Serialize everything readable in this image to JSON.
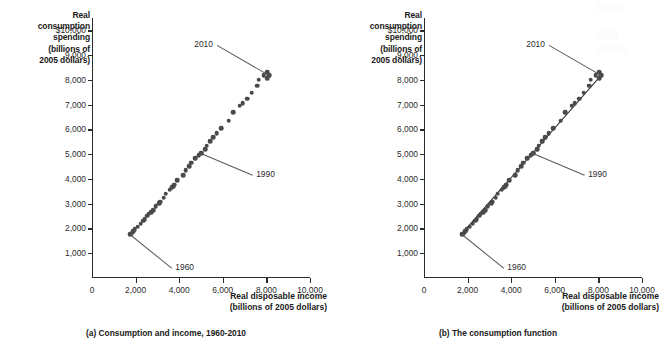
{
  "figure": {
    "panels": [
      {
        "id": "a",
        "caption": "(a) Consumption and income, 1960-2010",
        "show_fit_line": false
      },
      {
        "id": "b",
        "caption": "(b)  The consumption function",
        "show_fit_line": true
      }
    ],
    "axis_titles": {
      "y_lines": [
        "Real",
        "consumption",
        "spending",
        "(billions of",
        "2005 dollars)"
      ],
      "x_lines": [
        "Real disposable income",
        "(billions of 2005 dollars)"
      ]
    },
    "annotations": [
      {
        "label": "1960",
        "target": "first-point"
      },
      {
        "label": "1990",
        "target": "mid-point"
      },
      {
        "label": "2010",
        "target": "last-point"
      }
    ]
  },
  "chart_data": {
    "type": "scatter",
    "title": "",
    "xlabel": "Real disposable income (billions of 2005 dollars)",
    "ylabel": "Real consumption spending (billions of 2005 dollars)",
    "xlim": [
      0,
      10000
    ],
    "ylim": [
      0,
      10500
    ],
    "grid": false,
    "legend": false,
    "x_ticks": [
      0,
      2000,
      4000,
      6000,
      8000,
      10000
    ],
    "x_tick_labels": [
      "0",
      "2,000",
      "4,000",
      "6,000",
      "8,000",
      "10,000"
    ],
    "y_ticks": [
      1000,
      2000,
      3000,
      4000,
      5000,
      6000,
      7000,
      8000,
      9000,
      10000
    ],
    "y_tick_labels": [
      "1,000",
      "2,000",
      "3,000",
      "4,000",
      "5,000",
      "6,000",
      "7,000",
      "8,000",
      "9,000",
      "$10,000"
    ],
    "marker_color": "#4a4a4a",
    "line_color": "#2b2b2b",
    "series": [
      {
        "name": "Consumption vs. disposable income, 1960-2010",
        "years": [
          1960,
          1961,
          1962,
          1963,
          1964,
          1965,
          1966,
          1967,
          1968,
          1969,
          1970,
          1971,
          1972,
          1973,
          1974,
          1975,
          1976,
          1977,
          1978,
          1979,
          1980,
          1981,
          1982,
          1983,
          1984,
          1985,
          1986,
          1987,
          1988,
          1989,
          1990,
          1991,
          1992,
          1993,
          1994,
          1995,
          1996,
          1997,
          1998,
          1999,
          2000,
          2001,
          2002,
          2003,
          2004,
          2005,
          2006,
          2007,
          2008,
          2009,
          2010
        ],
        "x": [
          1760,
          1800,
          1890,
          1960,
          2100,
          2230,
          2340,
          2420,
          2530,
          2610,
          2720,
          2810,
          2930,
          3110,
          3090,
          3160,
          3280,
          3390,
          3560,
          3650,
          3650,
          3740,
          3780,
          3910,
          4180,
          4300,
          4450,
          4550,
          4740,
          4900,
          5010,
          5010,
          5180,
          5270,
          5420,
          5560,
          5720,
          5940,
          6270,
          6490,
          6780,
          6910,
          7130,
          7320,
          7580,
          7650,
          7880,
          8050,
          8100,
          8030,
          8130
        ],
        "y": [
          1760,
          1790,
          1880,
          1960,
          2070,
          2200,
          2320,
          2380,
          2510,
          2600,
          2650,
          2740,
          2910,
          3050,
          3020,
          3080,
          3240,
          3400,
          3560,
          3660,
          3640,
          3700,
          3760,
          3950,
          4140,
          4360,
          4510,
          4650,
          4830,
          4970,
          5060,
          5020,
          5190,
          5340,
          5530,
          5680,
          5840,
          6050,
          6360,
          6690,
          6950,
          7060,
          7240,
          7490,
          7760,
          8000,
          8200,
          8300,
          8200,
          8070,
          8180
        ]
      }
    ],
    "fit_line": {
      "description": "linear consumption function fitted through scatter in panel (b)",
      "intercept": 40,
      "slope": 1.0,
      "x_range": [
        1760,
        8130
      ]
    }
  }
}
